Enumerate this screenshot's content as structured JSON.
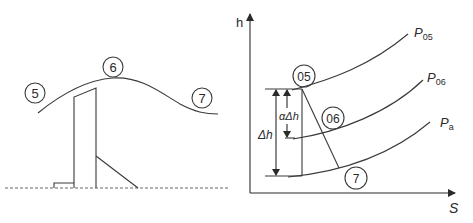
{
  "left_diagram": {
    "stations": [
      {
        "id": "5",
        "label": "5"
      },
      {
        "id": "6",
        "label": "6"
      },
      {
        "id": "7",
        "label": "7"
      }
    ]
  },
  "right_diagram": {
    "axes": {
      "y_label": "h",
      "x_label": "S"
    },
    "isobars": [
      {
        "name": "P05",
        "base": "P",
        "sub": "05"
      },
      {
        "name": "P06",
        "base": "P",
        "sub": "06"
      },
      {
        "name": "Pa",
        "base": "P",
        "sub": "a"
      }
    ],
    "states": [
      {
        "id": "05",
        "label": "05"
      },
      {
        "id": "06",
        "label": "06"
      },
      {
        "id": "7",
        "label": "7"
      }
    ],
    "dimensions": {
      "total_drop": "Δh",
      "fraction_drop": "αΔh"
    }
  }
}
